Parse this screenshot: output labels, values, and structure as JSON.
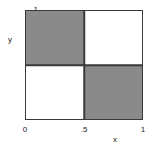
{
  "chart_data": {
    "type": "heatmap",
    "title": "",
    "xlabel": "x",
    "ylabel": "y",
    "xlim": [
      0,
      1
    ],
    "ylim": [
      0,
      1
    ],
    "grid": false,
    "legend": "none",
    "x_tick_labels": [
      "0",
      ".5",
      "1"
    ],
    "x_tick_values": [
      0,
      0.5,
      1
    ],
    "y_tick_labels": [
      "0",
      ".5",
      "1"
    ],
    "y_tick_values": [
      0,
      0.5,
      1
    ],
    "x_bin_edges": [
      0,
      0.5,
      1
    ],
    "y_bin_edges": [
      0,
      0.5,
      1
    ],
    "colors": {
      "filled": "#8a8a8a",
      "empty": "#ffffff",
      "frame": "#3a3a3a"
    },
    "cells": [
      {
        "row": 0,
        "col": 0,
        "x_range": [
          0,
          0.5
        ],
        "y_range": [
          0.5,
          1
        ],
        "value": 1,
        "fill": "#8a8a8a"
      },
      {
        "row": 0,
        "col": 1,
        "x_range": [
          0.5,
          1
        ],
        "y_range": [
          0.5,
          1
        ],
        "value": 0,
        "fill": "#ffffff"
      },
      {
        "row": 1,
        "col": 0,
        "x_range": [
          0,
          0.5
        ],
        "y_range": [
          0,
          0.5
        ],
        "value": 0,
        "fill": "#ffffff"
      },
      {
        "row": 1,
        "col": 1,
        "x_range": [
          0.5,
          1
        ],
        "y_range": [
          0,
          0.5
        ],
        "value": 1,
        "fill": "#8a8a8a"
      }
    ],
    "values": [
      [
        1,
        0
      ],
      [
        0,
        1
      ]
    ]
  },
  "axes": {
    "y": {
      "label": "y",
      "tick_top": "1",
      "tick_mid": ".5"
    },
    "x": {
      "label": "x",
      "tick_left": "0",
      "tick_mid": ".5",
      "tick_right": "1"
    }
  }
}
